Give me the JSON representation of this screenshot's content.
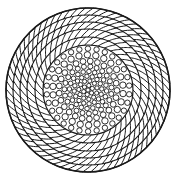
{
  "figure": {
    "kind": "technical-cross-section",
    "background_color": "#ffffff",
    "stroke_color": "#1a1a1a",
    "fill_color": "#ffffff",
    "canvas": {
      "width": 178,
      "height": 180
    }
  },
  "geometry": {
    "center_x": 88,
    "center_y": 90,
    "outer_radius": 82,
    "core_radius": 45,
    "outer_boundary_stroke_width": 1.6,
    "ring_boundary_stroke_width": 1.1,
    "cell_stroke_width": 1.0,
    "wire_stroke_width": 0.9
  },
  "chart_data": {
    "type": "scatter",
    "xlabel": "",
    "ylabel": "",
    "grid": false,
    "legend_position": "none",
    "annotations": [],
    "outer_strand_bands": [
      {
        "index": 0,
        "inner_radius": 45,
        "outer_radius": 53,
        "cell_count": 42,
        "slant": "clockwise"
      },
      {
        "index": 1,
        "inner_radius": 53,
        "outer_radius": 61,
        "cell_count": 48,
        "slant": "clockwise"
      },
      {
        "index": 2,
        "inner_radius": 61,
        "outer_radius": 68,
        "cell_count": 54,
        "slant": "clockwise"
      },
      {
        "index": 3,
        "inner_radius": 68,
        "outer_radius": 75,
        "cell_count": 60,
        "slant": "clockwise"
      },
      {
        "index": 4,
        "inner_radius": 75,
        "outer_radius": 82,
        "cell_count": 66,
        "slant": "clockwise"
      }
    ],
    "core_wire_rings": [
      {
        "index": 0,
        "radius": 0.0,
        "wire_count": 1,
        "wire_diameter": 4.2
      },
      {
        "index": 1,
        "radius": 4.6,
        "wire_count": 6,
        "wire_diameter": 4.2
      },
      {
        "index": 2,
        "radius": 9.2,
        "wire_count": 11,
        "wire_diameter": 4.2
      },
      {
        "index": 3,
        "radius": 13.8,
        "wire_count": 16,
        "wire_diameter": 4.4
      },
      {
        "index": 4,
        "radius": 18.6,
        "wire_count": 20,
        "wire_diameter": 4.6
      },
      {
        "index": 5,
        "radius": 23.6,
        "wire_count": 23,
        "wire_diameter": 5.0
      },
      {
        "index": 6,
        "radius": 29.0,
        "wire_count": 25,
        "wire_diameter": 5.8
      },
      {
        "index": 7,
        "radius": 35.2,
        "wire_count": 26,
        "wire_diameter": 6.4
      },
      {
        "index": 8,
        "radius": 41.4,
        "wire_count": 30,
        "wire_diameter": 5.4
      }
    ]
  }
}
